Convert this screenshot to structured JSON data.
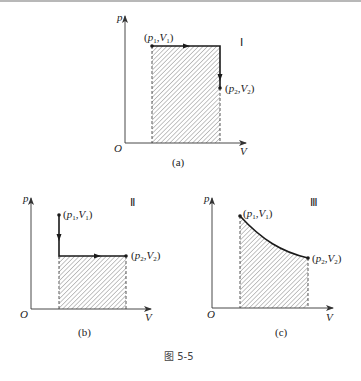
{
  "figure": {
    "title": "图 5-5"
  },
  "panels": [
    {
      "id": "a",
      "caption": "(a)",
      "roman": "Ⅰ",
      "axes": {
        "y_label": "p",
        "x_label": "V",
        "origin": "O"
      },
      "point1": {
        "p": "p",
        "p_sub": "1",
        "v": "V",
        "v_sub": "1"
      },
      "point2": {
        "p": "p",
        "p_sub": "2",
        "v": "V",
        "v_sub": "2"
      },
      "process": "isobaric expansion then isochoric pressure drop"
    },
    {
      "id": "b",
      "caption": "(b)",
      "roman": "Ⅱ",
      "axes": {
        "y_label": "p",
        "x_label": "V",
        "origin": "O"
      },
      "point1": {
        "p": "p",
        "p_sub": "1",
        "v": "V",
        "v_sub": "1"
      },
      "point2": {
        "p": "p",
        "p_sub": "2",
        "v": "V",
        "v_sub": "2"
      },
      "process": "isochoric pressure drop then isobaric expansion"
    },
    {
      "id": "c",
      "caption": "(c)",
      "roman": "Ⅲ",
      "axes": {
        "y_label": "p",
        "x_label": "V",
        "origin": "O"
      },
      "point1": {
        "p": "p",
        "p_sub": "1",
        "v": "V",
        "v_sub": "1"
      },
      "point2": {
        "p": "p",
        "p_sub": "2",
        "v": "V",
        "v_sub": "2"
      },
      "process": "curved expansion path"
    }
  ],
  "colors": {
    "line": "#1a1a1a",
    "axis": "#333333",
    "hatch": "#7a7a7a",
    "dashed": "#444444"
  }
}
